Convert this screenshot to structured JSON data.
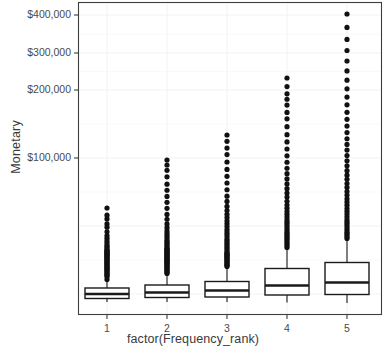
{
  "chart_data": {
    "type": "box",
    "title": "",
    "subtitle": "",
    "xlabel": "factor(Frequency_rank)",
    "ylabel": "Monetary",
    "grid": true,
    "legend": "none",
    "categories": [
      "1",
      "2",
      "3",
      "4",
      "5"
    ],
    "y_tick_labels": [
      "$400,000",
      "$300,000",
      "$200,000",
      "$100,000"
    ],
    "y_tick_values": [
      400000,
      300000,
      200000,
      100000
    ],
    "ylim": [
      0,
      430000
    ],
    "xlim": [
      0.4,
      5.6
    ],
    "boxes": [
      {
        "category": "1",
        "lower_whisker": 500,
        "q1": 9000,
        "median": 14000,
        "q3": 22000,
        "upper_whisker": 41000,
        "outliers": [
          42000,
          44000,
          45000,
          46000,
          47000,
          48000,
          49000,
          50000,
          51000,
          52000,
          53000,
          54000,
          55000,
          56000,
          57000,
          58000,
          59000,
          60000,
          61000,
          62000,
          63000,
          64000,
          65000,
          66000,
          67000,
          68000,
          69000,
          70000,
          72000,
          74000,
          76000,
          79000,
          82000,
          86000,
          90000,
          96000,
          104000,
          110000,
          120000,
          128000,
          145000
        ]
      },
      {
        "category": "2",
        "lower_whisker": 1000,
        "q1": 11000,
        "median": 18000,
        "q3": 30000,
        "upper_whisker": 56000,
        "outliers": [
          57000,
          58000,
          59000,
          60000,
          61000,
          62000,
          63000,
          64000,
          65000,
          66000,
          67000,
          68000,
          69000,
          70000,
          71000,
          72000,
          73000,
          74000,
          75000,
          76000,
          77000,
          78000,
          79000,
          80000,
          81000,
          82000,
          84000,
          86000,
          88000,
          90000,
          92000,
          95000,
          98000,
          101000,
          105000,
          110000,
          116000,
          124000,
          133000,
          145000,
          158000,
          172000,
          188000,
          205000,
          228000,
          250000,
          270000,
          290000
        ]
      },
      {
        "category": "3",
        "lower_whisker": 1500,
        "q1": 14000,
        "median": 23000,
        "q3": 37000,
        "upper_whisker": 68000,
        "outliers": [
          69000,
          70000,
          71000,
          72000,
          73000,
          74000,
          75000,
          76000,
          77000,
          78000,
          79000,
          80000,
          81000,
          82000,
          84000,
          86000,
          88000,
          90000,
          92000,
          94000,
          96000,
          99000,
          102000,
          105000,
          108000,
          112000,
          116000,
          120000,
          125000,
          130000,
          136000,
          143000,
          152000,
          162000,
          175000,
          190000,
          206000,
          224000,
          245000,
          268000,
          290000,
          315000,
          340000
        ]
      },
      {
        "category": "4",
        "lower_whisker": 2000,
        "q1": 20000,
        "median": 36000,
        "q3": 58000,
        "upper_whisker": 105000,
        "outliers": [
          107000,
          109000,
          111000,
          113000,
          115000,
          117000,
          119000,
          121000,
          123000,
          125000,
          128000,
          131000,
          134000,
          137000,
          140000,
          144000,
          148000,
          152000,
          157000,
          162000,
          168000,
          175000,
          182000,
          190000,
          199000,
          209000,
          220000,
          232000,
          246000,
          262000,
          280000,
          300000,
          322000,
          348000,
          376000,
          400000,
          430000,
          455000,
          480000,
          515000,
          560000
        ]
      },
      {
        "category": "5",
        "lower_whisker": 2500,
        "q1": 26000,
        "median": 45000,
        "q3": 72000,
        "upper_whisker": 130000,
        "outliers": [
          132000,
          134000,
          136000,
          138000,
          140000,
          143000,
          146000,
          149000,
          152000,
          155000,
          159000,
          163000,
          167000,
          171000,
          176000,
          181000,
          186000,
          192000,
          198000,
          205000,
          212000,
          220000,
          228000,
          237000,
          247000,
          258000,
          270000,
          283000,
          297000,
          312000,
          329000,
          348000,
          369000,
          392000,
          418000,
          447000,
          480000,
          517000,
          560000,
          610000,
          668000,
          735000,
          815000,
          915000
        ]
      }
    ]
  },
  "geometry": {
    "panel": {
      "left": 78,
      "top": 2,
      "right": 382,
      "bottom": 315
    },
    "y_tick_pixels": [
      15,
      53,
      90,
      158
    ],
    "x_tick_pixels": [
      107,
      167,
      227,
      287,
      347
    ],
    "box_half_width": 22,
    "outlier_radius": 2.6,
    "box_pixels": [
      {
        "q3_px": 288.0,
        "median_px": 294.0,
        "q1_px": 298.5,
        "top_whisker_px": 281.0,
        "bottom_whisker_px": 302.0,
        "outlier_top_px": 208.0
      },
      {
        "q3_px": 285.0,
        "median_px": 292.5,
        "q1_px": 297.5,
        "top_whisker_px": 275.0,
        "bottom_whisker_px": 302.0,
        "outlier_top_px": 160.0
      },
      {
        "q3_px": 281.5,
        "median_px": 290.5,
        "q1_px": 297.0,
        "top_whisker_px": 268.0,
        "bottom_whisker_px": 302.0,
        "outlier_top_px": 135.0
      },
      {
        "q3_px": 268.5,
        "median_px": 285.5,
        "q1_px": 295.0,
        "top_whisker_px": 249.0,
        "bottom_whisker_px": 302.5,
        "outlier_top_px": 78.0
      },
      {
        "q3_px": 262.5,
        "median_px": 282.5,
        "q1_px": 294.5,
        "top_whisker_px": 240.0,
        "bottom_whisker_px": 303.0,
        "outlier_top_px": 14.0
      }
    ]
  },
  "colors": {
    "panel_background": "#ffffff",
    "panel_border": "#3d3d3d",
    "gridline_major": "#f2f2f2",
    "gridline_minor": "#f8f8f8",
    "box_fill": "#ffffff",
    "box_stroke": "#1a1a1a",
    "outlier": "#111111",
    "axis_text": "#4a4a4a",
    "axis_title": "#3a3a3a"
  }
}
